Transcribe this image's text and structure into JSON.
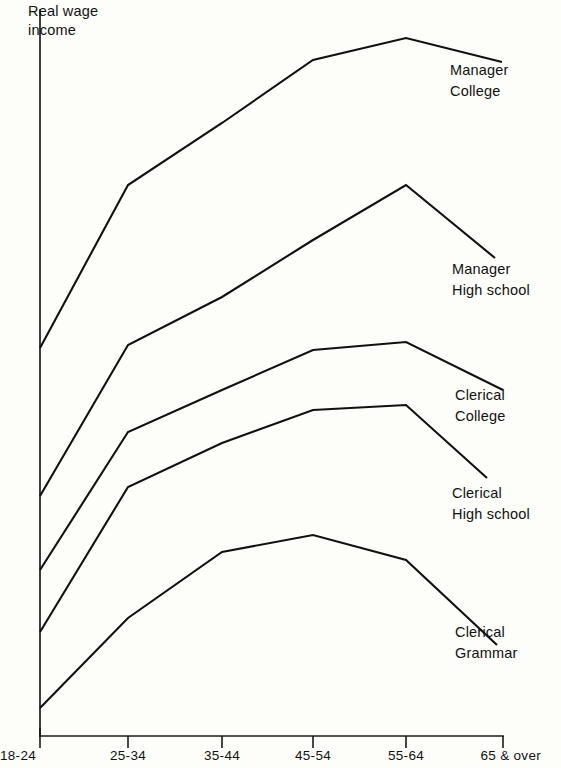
{
  "chart_data": {
    "type": "line",
    "title": "",
    "subtitle": "",
    "xlabel": "",
    "ylabel": "Real wage\nincome",
    "categories": [
      "18-24",
      "25-34",
      "35-44",
      "45-54",
      "55-64",
      "65 & over"
    ],
    "grid": false,
    "legend_position": "right-inline-annotations",
    "axis_note": "Y axis unlabeled / no numeric ticks; values are relative index estimated from pixel heights (0 = x-axis baseline, 100 = top of plot area)",
    "ylim": [
      0,
      100
    ],
    "series": [
      {
        "name": "Manager College",
        "label": "Manager\nCollege",
        "values": [
          52,
          75,
          84,
          93,
          96,
          92
        ],
        "pixel_y": [
          348,
          185,
          123,
          60,
          38,
          62
        ]
      },
      {
        "name": "Manager High school",
        "label": "Manager\nHigh school",
        "values": [
          31,
          53,
          60,
          68,
          75,
          65
        ],
        "pixel_y": [
          496,
          345,
          297,
          240,
          185,
          258
        ]
      },
      {
        "name": "Clerical College",
        "label": "Clerical\nCollege",
        "values": [
          20,
          39,
          45,
          51,
          52,
          45
        ],
        "pixel_y": [
          570,
          432,
          390,
          350,
          342,
          390
        ]
      },
      {
        "name": "Clerical High school",
        "label": "Clerical\nHigh school",
        "values": [
          11,
          32,
          37,
          42,
          43,
          32
        ],
        "pixel_y": [
          632,
          487,
          443,
          410,
          405,
          478
        ]
      },
      {
        "name": "Clerical Grammar",
        "label": "Clerical\nGrammar",
        "values": [
          1,
          14,
          24,
          27,
          24,
          12
        ],
        "pixel_y": [
          708,
          618,
          552,
          535,
          560,
          645
        ]
      }
    ]
  },
  "axis": {
    "y_caption_line1": "Real wage",
    "y_caption_line2": "income",
    "x_ticks": [
      {
        "label": "18-24",
        "x": 40
      },
      {
        "label": "25-34",
        "x": 128
      },
      {
        "label": "35-44",
        "x": 222
      },
      {
        "label": "45-54",
        "x": 313
      },
      {
        "label": "55-64",
        "x": 406
      },
      {
        "label": "65 & over",
        "x": 503
      }
    ]
  },
  "annotations": [
    {
      "name": "manager-college",
      "line1": "Manager",
      "line2": "College",
      "x": 450,
      "y": 60
    },
    {
      "name": "manager-high-school",
      "line1": "Manager",
      "line2": "High school",
      "x": 452,
      "y": 259
    },
    {
      "name": "clerical-college",
      "line1": "Clerical",
      "line2": "College",
      "x": 455,
      "y": 385
    },
    {
      "name": "clerical-high-school",
      "line1": "Clerical",
      "line2": "High school",
      "x": 452,
      "y": 483
    },
    {
      "name": "clerical-grammar",
      "line1": "Clerical",
      "line2": "Grammar",
      "x": 455,
      "y": 622
    }
  ],
  "colors": {
    "ink": "#111111",
    "paper": "#fdfdfa"
  }
}
